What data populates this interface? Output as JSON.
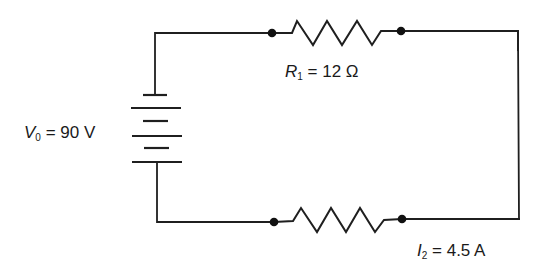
{
  "diagram": {
    "type": "circuit-schematic",
    "colors": {
      "background": "#ffffff",
      "line": "#1f1f1f",
      "text": "#1a1a1a"
    },
    "components": [
      {
        "id": "battery",
        "kind": "battery",
        "label": {
          "symbol": "V",
          "subscript": "0",
          "equals": " = ",
          "value": "90 V"
        }
      },
      {
        "id": "resistor-top",
        "kind": "resistor",
        "label": {
          "symbol": "R",
          "subscript": "1",
          "equals": " = ",
          "value": "12 Ω"
        }
      },
      {
        "id": "resistor-bottom",
        "kind": "resistor",
        "label": null
      }
    ],
    "annotations": [
      {
        "id": "current-label",
        "symbol": "I",
        "subscript": "2",
        "equals": " = ",
        "value": "4.5 A"
      }
    ],
    "nodes": 4
  }
}
